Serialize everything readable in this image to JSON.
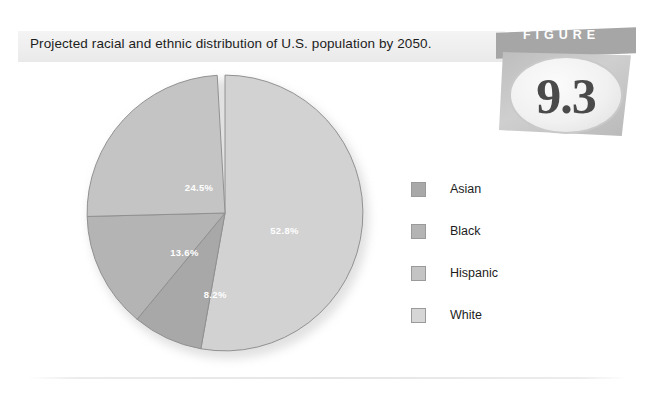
{
  "caption": {
    "text": "Projected racial and ethnic distribution of U.S. population by 2050."
  },
  "badge": {
    "banner_label": "FIGURE",
    "number": "9.3"
  },
  "chart_data": {
    "type": "pie",
    "title": "Projected racial and ethnic distribution of U.S. population by 2050.",
    "categories": [
      "White",
      "Asian",
      "Black",
      "Hispanic"
    ],
    "values": [
      52.8,
      8.2,
      13.6,
      24.5
    ],
    "unit": "%",
    "start_angle_deg": 0,
    "direction": "clockwise",
    "legend_position": "right",
    "legend_order": [
      "Asian",
      "Black",
      "Hispanic",
      "White"
    ],
    "grid": false,
    "xlabel": "",
    "ylabel": "",
    "slices": [
      {
        "label": "White",
        "value": 52.8,
        "display": "52.8%",
        "color": "#d2d2d2",
        "start_deg": 0,
        "end_deg": 190.08,
        "label_x": 285,
        "label_y": 227
      },
      {
        "label": "Asian",
        "value": 8.2,
        "display": "8.2%",
        "color": "#a8a8a8",
        "start_deg": 190.08,
        "end_deg": 219.6,
        "label_x": 186,
        "label_y": 318
      },
      {
        "label": "Black",
        "value": 13.6,
        "display": "13.6%",
        "color": "#b4b4b4",
        "start_deg": 219.6,
        "end_deg": 268.56,
        "label_x": 142,
        "label_y": 258
      },
      {
        "label": "Hispanic",
        "value": 24.5,
        "display": "24.5%",
        "color": "#c4c4c4",
        "start_deg": 268.56,
        "end_deg": 356.76,
        "label_x": 163,
        "label_y": 165
      }
    ]
  },
  "legend": {
    "items": [
      {
        "label": "Asian",
        "color": "#a8a8a8"
      },
      {
        "label": "Black",
        "color": "#b4b4b4"
      },
      {
        "label": "Hispanic",
        "color": "#c4c4c4"
      },
      {
        "label": "White",
        "color": "#d6d6d6"
      }
    ]
  }
}
